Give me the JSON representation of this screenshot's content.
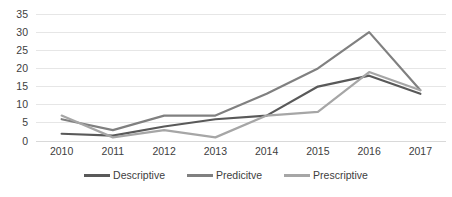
{
  "chart_data": {
    "type": "line",
    "title": "",
    "xlabel": "",
    "ylabel": "",
    "categories": [
      "2010",
      "2011",
      "2012",
      "2013",
      "2014",
      "2015",
      "2016",
      "2017"
    ],
    "series": [
      {
        "name": "Descriptive",
        "color": "#595959",
        "values": [
          2,
          1.5,
          4,
          6,
          7,
          15,
          18,
          13
        ]
      },
      {
        "name": "Predicitve",
        "color": "#808080",
        "values": [
          6,
          3,
          7,
          7,
          13,
          20,
          30,
          14
        ]
      },
      {
        "name": "Prescriptive",
        "color": "#a6a6a6",
        "values": [
          7,
          1,
          3,
          1,
          7,
          8,
          19,
          14
        ]
      }
    ],
    "ylim": [
      0,
      35
    ],
    "yticks": [
      0,
      5,
      10,
      15,
      20,
      25,
      30,
      35
    ],
    "ytick_labels": [
      "0",
      "5",
      "10",
      "15",
      "20",
      "25",
      "30",
      "35"
    ],
    "grid": true,
    "gridcolor": "#e6e6e6",
    "legend_position": "bottom",
    "axis_color": "#d9d9d9",
    "tick_label_color": "#404040",
    "background": "#ffffff"
  }
}
